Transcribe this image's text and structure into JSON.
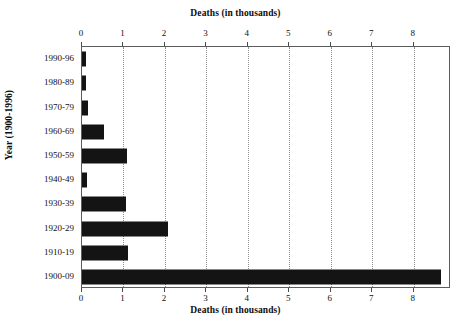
{
  "chart_data": {
    "type": "bar",
    "orientation": "horizontal",
    "title": "",
    "xlabel": "Deaths (in thousands)",
    "ylabel": "Year (1900-1996)",
    "xlabel_top": "Deaths (in thousands)",
    "xlabel_bottom": "Deaths (in thousands)",
    "categories": [
      "1990-96",
      "1980-89",
      "1970-79",
      "1960-69",
      "1950-59",
      "1940-49",
      "1930-39",
      "1920-29",
      "1910-19",
      "1900-09"
    ],
    "values": [
      0.1,
      0.1,
      0.15,
      0.53,
      1.08,
      0.12,
      1.05,
      2.08,
      1.12,
      8.66
    ],
    "xticks": [
      0,
      1,
      2,
      3,
      4,
      5,
      6,
      7,
      8
    ],
    "xticklabels": [
      "0",
      "1",
      "2",
      "3",
      "4",
      "5",
      "6",
      "7",
      "8"
    ],
    "xlim": [
      0,
      8.9
    ],
    "grid": "vertical-dotted",
    "legend": null,
    "bar_color": "#141414",
    "axis_color": "#5c5c5c",
    "grid_color": "#8f8f8f"
  }
}
